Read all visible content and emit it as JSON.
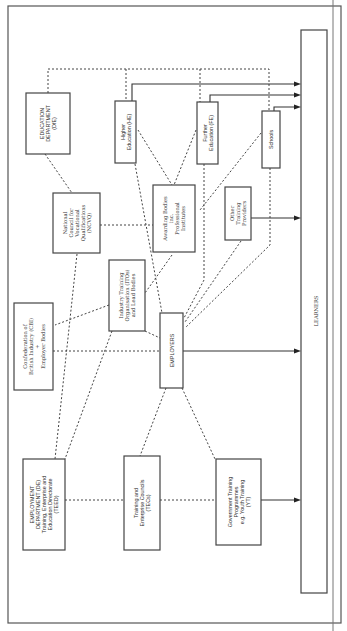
{
  "diagram": {
    "orientation": "rotated-90-ccw",
    "nodes": {
      "education_department": {
        "lines": [
          "EDUCATION",
          "DEPARTMENT",
          "(DfE)"
        ]
      },
      "higher_education": {
        "lines": [
          "Higher",
          "Education (HE)"
        ]
      },
      "further_education": {
        "lines": [
          "Further",
          "Education (FE)"
        ]
      },
      "schools": {
        "lines": [
          "Schools"
        ]
      },
      "awarding_bodies": {
        "lines": [
          "Awarding Bodies",
          "inc.",
          "Professional",
          "Institutes"
        ]
      },
      "other_training_providers": {
        "lines": [
          "Other",
          "Training",
          "Providers"
        ]
      },
      "ncvq": {
        "lines": [
          "National",
          "Council for",
          "Vocational",
          "Qualifications",
          "(NCVQ)"
        ]
      },
      "itos": {
        "lines": [
          "Industry Training",
          "Organisation (ITOs)",
          "and Lead Bodies"
        ]
      },
      "cbi": {
        "lines": [
          "Confederation of",
          "British Industry (CBI)",
          "+",
          "Employer Bodies"
        ]
      },
      "employers": {
        "lines": [
          "EMPLOYERS"
        ]
      },
      "employment_department": {
        "lines": [
          "EMPLOYMENT",
          "DEPARTMENT (DE)",
          "Training, Enterprise and",
          "Education Directorate",
          "(TEED)"
        ]
      },
      "tecs": {
        "lines": [
          "Training and",
          "Enterprise Councils",
          "(TECs)"
        ]
      },
      "government_training": {
        "lines": [
          "Government Training",
          "Programmes",
          "e.g. Youth Training",
          "(YT)"
        ]
      },
      "learners": {
        "lines": [
          "LEARNERS"
        ]
      }
    },
    "edges": {
      "solid_arrows_to_learners": [
        "higher_education",
        "further_education",
        "schools",
        "other_training_providers",
        "employers",
        "government_training"
      ],
      "dashed_links": [
        [
          "education_department",
          "higher_education"
        ],
        [
          "education_department",
          "further_education"
        ],
        [
          "education_department",
          "schools"
        ],
        [
          "education_department",
          "ncvq"
        ],
        [
          "ncvq",
          "awarding_bodies"
        ],
        [
          "ncvq",
          "employment_department"
        ],
        [
          "higher_education",
          "awarding_bodies"
        ],
        [
          "further_education",
          "awarding_bodies"
        ],
        [
          "schools",
          "awarding_bodies"
        ],
        [
          "higher_education",
          "employers"
        ],
        [
          "further_education",
          "employers"
        ],
        [
          "schools",
          "employers"
        ],
        [
          "other_training_providers",
          "employers"
        ],
        [
          "awarding_bodies",
          "itos"
        ],
        [
          "itos",
          "employers"
        ],
        [
          "itos",
          "cbi"
        ],
        [
          "itos",
          "employment_department"
        ],
        [
          "cbi",
          "employers"
        ],
        [
          "employers",
          "tecs"
        ],
        [
          "employers",
          "government_training"
        ],
        [
          "employment_department",
          "tecs"
        ],
        [
          "tecs",
          "government_training"
        ]
      ]
    }
  }
}
